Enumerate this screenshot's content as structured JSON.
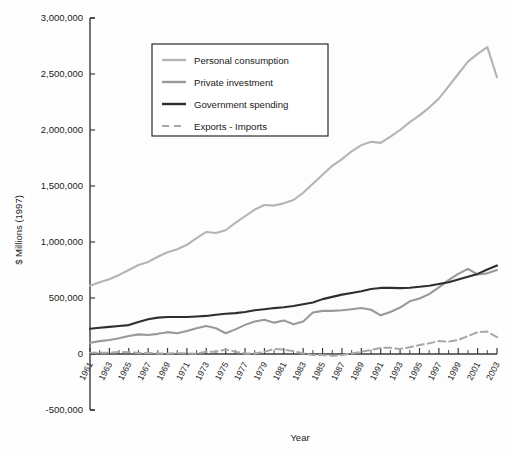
{
  "chart_data": {
    "type": "line",
    "title": "",
    "xlabel": "Year",
    "ylabel": "$ Millions (1997)",
    "ylim": [
      -500000,
      3000000
    ],
    "xlim": [
      1961,
      2003
    ],
    "ytick_labels": [
      "3,000,000",
      "2,500,000",
      "2,000,000",
      "1,500,000",
      "1,000,000",
      "500,000",
      "0",
      "-500,000"
    ],
    "ytick_values": [
      3000000,
      2500000,
      2000000,
      1500000,
      1000000,
      500000,
      0,
      -500000
    ],
    "xtick_labels": [
      "1961",
      "1963",
      "1965",
      "1967",
      "1969",
      "1971",
      "1973",
      "1975",
      "1977",
      "1979",
      "1981",
      "1983",
      "1985",
      "1987",
      "1989",
      "1991",
      "1993",
      "1995",
      "1997",
      "1999",
      "2001",
      "2003"
    ],
    "grid": false,
    "legend_position": "upper-left",
    "x": [
      1961,
      1962,
      1963,
      1964,
      1965,
      1966,
      1967,
      1968,
      1969,
      1970,
      1971,
      1972,
      1973,
      1974,
      1975,
      1976,
      1977,
      1978,
      1979,
      1980,
      1981,
      1982,
      1983,
      1984,
      1985,
      1986,
      1987,
      1988,
      1989,
      1990,
      1991,
      1992,
      1993,
      1994,
      1995,
      1996,
      1997,
      1998,
      1999,
      2000,
      2001,
      2002,
      2003
    ],
    "series": [
      {
        "name": "Personal consumption",
        "color": "#b4b4b4",
        "style": "solid",
        "values": [
          610000,
          640000,
          668000,
          706000,
          750000,
          795000,
          822000,
          868000,
          908000,
          935000,
          975000,
          1035000,
          1090000,
          1080000,
          1105000,
          1170000,
          1230000,
          1290000,
          1330000,
          1325000,
          1345000,
          1375000,
          1440000,
          1520000,
          1600000,
          1680000,
          1740000,
          1810000,
          1865000,
          1895000,
          1885000,
          1940000,
          2000000,
          2070000,
          2130000,
          2200000,
          2280000,
          2390000,
          2500000,
          2610000,
          2680000,
          2740000,
          2470000
        ]
      },
      {
        "name": "Private investment",
        "color": "#999999",
        "style": "solid",
        "values": [
          100000,
          115000,
          125000,
          140000,
          160000,
          175000,
          170000,
          180000,
          195000,
          185000,
          205000,
          230000,
          250000,
          230000,
          185000,
          220000,
          260000,
          290000,
          305000,
          280000,
          300000,
          265000,
          290000,
          370000,
          385000,
          385000,
          390000,
          400000,
          410000,
          395000,
          345000,
          375000,
          415000,
          470000,
          495000,
          535000,
          595000,
          660000,
          715000,
          760000,
          710000,
          720000,
          750000
        ]
      },
      {
        "name": "Government spending",
        "color": "#2e2e2e",
        "style": "solid",
        "values": [
          225000,
          235000,
          242000,
          250000,
          258000,
          285000,
          310000,
          325000,
          330000,
          330000,
          330000,
          335000,
          340000,
          350000,
          360000,
          365000,
          375000,
          390000,
          400000,
          410000,
          418000,
          428000,
          445000,
          460000,
          490000,
          510000,
          530000,
          545000,
          560000,
          580000,
          590000,
          590000,
          588000,
          592000,
          600000,
          610000,
          625000,
          640000,
          665000,
          690000,
          715000,
          755000,
          790000
        ]
      },
      {
        "name": "Exports - Imports",
        "color": "#a8a8a8",
        "style": "dashed",
        "values": [
          12000,
          10000,
          12000,
          18000,
          15000,
          10000,
          10000,
          5000,
          5000,
          8000,
          5000,
          2000,
          20000,
          20000,
          40000,
          20000,
          5000,
          5000,
          20000,
          45000,
          40000,
          25000,
          5000,
          -10000,
          -10000,
          -15000,
          -10000,
          5000,
          20000,
          35000,
          55000,
          55000,
          45000,
          60000,
          80000,
          95000,
          115000,
          110000,
          125000,
          160000,
          195000,
          200000,
          150000
        ]
      }
    ]
  },
  "legend": {
    "items": [
      {
        "label": "Personal consumption"
      },
      {
        "label": "Private investment"
      },
      {
        "label": "Government spending"
      },
      {
        "label": "Exports - Imports"
      }
    ]
  },
  "axes": {
    "y_title": "$ Millions (1997)",
    "x_title": "Year"
  }
}
